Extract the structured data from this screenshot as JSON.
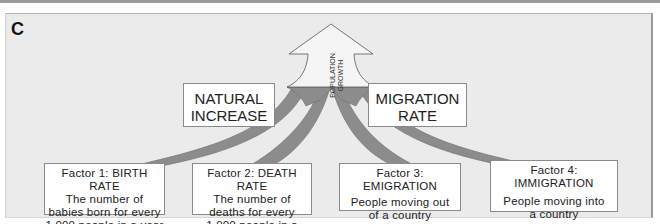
{
  "panel": {
    "letter": "C"
  },
  "arrow": {
    "label": "POPULATION\nGROWTH"
  },
  "components": [
    {
      "id": "natural-increase",
      "label": "NATURAL\nINCREASE"
    },
    {
      "id": "migration-rate",
      "label": "MIGRATION\nRATE"
    }
  ],
  "factors": [
    {
      "title": "Factor 1: BIRTH RATE",
      "desc": "The number of\nbabies born for every\n1,000 people in a year"
    },
    {
      "title": "Factor 2: DEATH RATE",
      "desc": "The number of\ndeaths for every\n1,000 people in a year"
    },
    {
      "title": "Factor 3: EMIGRATION",
      "desc": "People moving out\nof a country"
    },
    {
      "title": "Factor 4: IMMIGRATION",
      "desc": "People moving into\na country"
    }
  ],
  "colors": {
    "background": "#ebebeb",
    "stream": "#8c8c8c",
    "arrow_fill": "#f5f5f5",
    "box_border": "#8a8a8a"
  }
}
